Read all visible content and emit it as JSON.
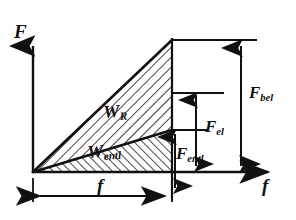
{
  "figure": {
    "type": "engineering-line-diagram",
    "background": "#ffffff",
    "ink": "#111111"
  },
  "axes": {
    "y": {
      "label": "F",
      "name": "force-axis",
      "arrow": "up",
      "origin_px": [
        33,
        172
      ],
      "tip_px": [
        33,
        36
      ]
    },
    "x": {
      "label": "f",
      "name": "deflection-axis",
      "arrow": "right",
      "origin_px": [
        33,
        172
      ],
      "tip_px": [
        278,
        172
      ]
    }
  },
  "regions": [
    {
      "id": "W_R",
      "label": "W",
      "sub": "R",
      "name": "friction-work-area",
      "hatch": "backslash",
      "description": "Upper hatched triangle between loading line and unloading line"
    },
    {
      "id": "W_entl",
      "label": "W",
      "sub": "entl",
      "name": "unloading-work-area",
      "hatch": "forwardslash",
      "description": "Lower hatched triangle under the unloading line"
    }
  ],
  "force_dimensions": [
    {
      "id": "F_bel",
      "label": "F",
      "sub": "bel",
      "name": "loading-force-dimension",
      "arrows": "double",
      "from_px": [
        241,
        40
      ],
      "to_px": [
        241,
        172
      ]
    },
    {
      "id": "F_el",
      "label": "F",
      "sub": "el",
      "name": "elastic-force-dimension",
      "arrows": "double",
      "from_px": [
        196,
        93
      ],
      "to_px": [
        196,
        172
      ]
    },
    {
      "id": "F_entl",
      "label": "F",
      "sub": "entl",
      "name": "unloading-force-dimension",
      "arrows": "double",
      "from_px": [
        175,
        130
      ],
      "to_px": [
        175,
        190
      ]
    }
  ],
  "length_dimensions": [
    {
      "id": "f",
      "label": "f",
      "name": "deflection-dimension",
      "arrows": "double-ended",
      "from_px": [
        33,
        196
      ],
      "to_px": [
        172,
        196
      ]
    }
  ],
  "geometry": {
    "origin": [
      33,
      172
    ],
    "peak": [
      172,
      40
    ],
    "unload_knee": [
      172,
      130
    ],
    "elastic_level": [
      172,
      93
    ],
    "vertical_divider_x": 172,
    "baseline_y": 172,
    "top_line_y": 40,
    "top_line_to_x": 257,
    "elastic_line_to_x": 224,
    "knee_line_to_x": 207
  }
}
